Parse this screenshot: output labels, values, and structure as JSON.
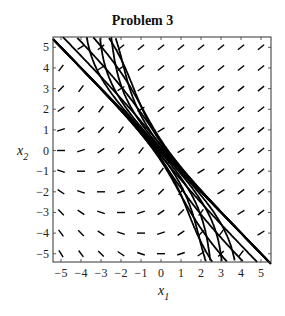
{
  "chart_data": {
    "type": "vector-field",
    "title": "Problem 3",
    "xlabel": "x",
    "xlabel_sub": "1",
    "ylabel": "x",
    "ylabel_sub": "2",
    "xlim": [
      -5.4,
      5.5
    ],
    "ylim": [
      -5.4,
      5.5
    ],
    "xticks": [
      -5,
      -4,
      -3,
      -2,
      -1,
      0,
      1,
      2,
      3,
      4,
      5
    ],
    "yticks": [
      -5,
      -4,
      -3,
      -2,
      -1,
      0,
      1,
      2,
      3,
      4,
      5
    ],
    "grid": false,
    "separatrix": {
      "description": "straight trajectory along x2 = -x1",
      "from": [
        -5.4,
        5.4
      ],
      "to": [
        5.5,
        -5.5
      ]
    },
    "trajectory_description": "Trajectories run parallel to direction of slope ~1 far from the separatrix and bend to merge onto the line x2 = -x1",
    "trajectory_offsets_upper": [
      0.6,
      1.3,
      2.2,
      3.3,
      4.6,
      6.0,
      7.5,
      9.0
    ],
    "trajectory_offsets_lower": [
      -0.6,
      -1.3,
      -2.2,
      -3.3,
      -4.6,
      -6.0,
      -7.5,
      -9.0
    ],
    "direction_field_grid": [
      -5,
      -4,
      -3,
      -2,
      -1,
      0,
      1,
      2,
      3,
      4,
      5
    ]
  },
  "frame": {
    "left": 53,
    "top": 37,
    "right": 271,
    "bottom": 262
  }
}
